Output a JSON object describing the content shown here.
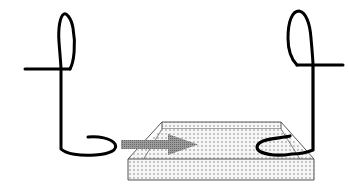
{
  "diagram": {
    "colors": {
      "background": "#ffffff",
      "stroke": "#000000",
      "arrow": "#8a8a8a",
      "platform_fill": "#f4f4f4",
      "platform_dots": "#6e6e6e",
      "platform_edge": "#555555"
    },
    "elements": [
      {
        "id": "left-figure",
        "type": "loop-stroke"
      },
      {
        "id": "platform",
        "type": "dotted-trapezoid-slab"
      },
      {
        "id": "motion-arrow",
        "type": "arrow",
        "direction": "right"
      },
      {
        "id": "right-figure",
        "type": "loop-stroke"
      }
    ]
  }
}
